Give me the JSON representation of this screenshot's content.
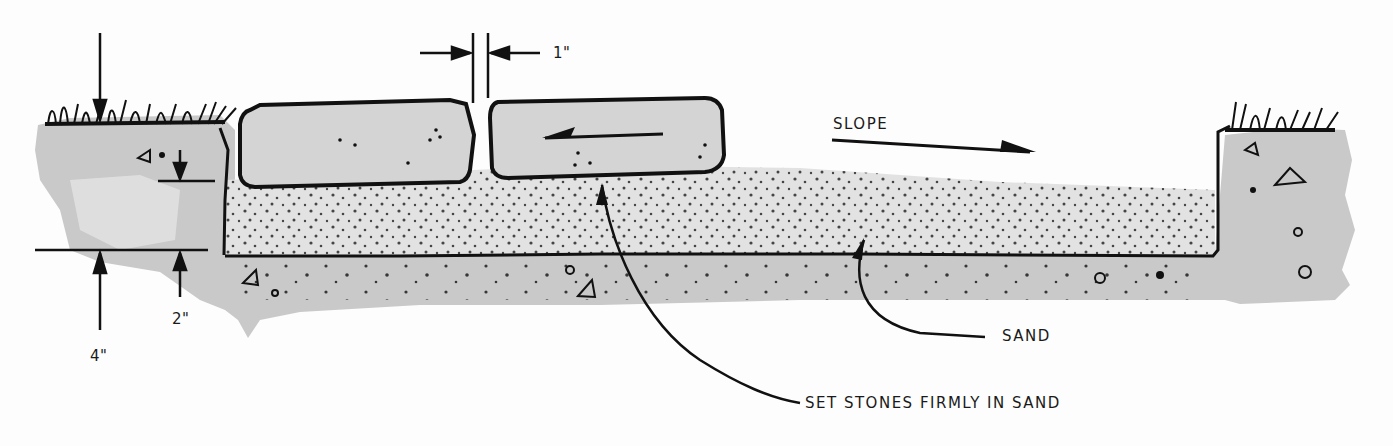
{
  "diagram": {
    "type": "cross-section",
    "colors": {
      "background": "#fdfdfd",
      "soil": "#c9c9c9",
      "soil_light": "#dcdcdc",
      "sand": "#e2e2e2",
      "stone": "#d4d4d4",
      "ink": "#111111"
    },
    "labels": {
      "gap": "1\"",
      "slope": "SLOPE",
      "sand": "SAND",
      "set_stones": "SET STONES FIRMLY IN SAND",
      "depth_total": "4\"",
      "depth_sand": "2\""
    },
    "elements": [
      {
        "id": "stone-left",
        "kind": "stone"
      },
      {
        "id": "stone-right",
        "kind": "stone",
        "has_arrow": "left"
      },
      {
        "id": "sand-bed",
        "kind": "sand layer"
      },
      {
        "id": "grass-left",
        "kind": "grass"
      },
      {
        "id": "grass-right",
        "kind": "grass"
      },
      {
        "id": "slope-arrow",
        "kind": "arrow",
        "direction": "right-down"
      }
    ]
  }
}
